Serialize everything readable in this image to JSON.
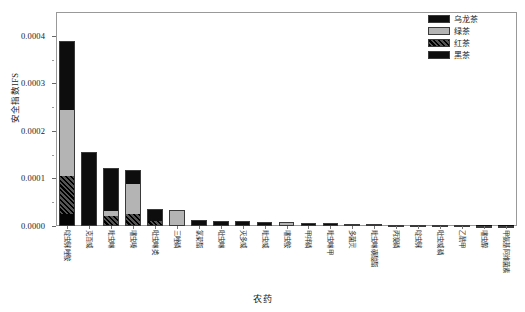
{
  "chart_data": {
    "type": "bar",
    "stacked": true,
    "title": "",
    "xlabel": "农药",
    "ylabel": "安全指数IFS",
    "ylim": [
      0.0,
      0.00045
    ],
    "ytick_values": [
      0.0,
      0.0001,
      0.0002,
      0.0003,
      0.0004
    ],
    "ytick_labels": [
      "0.0000",
      "0.0001",
      "0.0002",
      "0.0003",
      "0.0004"
    ],
    "grid": false,
    "legend_position": "top-right",
    "categories": [
      "啶虫脒唑胺",
      "克百威",
      "毗虫啉",
      "噻虫嗪",
      "吡虫啉类",
      "三唑磷",
      "氯菊酯",
      "吡虫啉",
      "灭多威",
      "毗虫威",
      "噻虫胺",
      "甲拌磷",
      "毗虫啉甲",
      "多菌灵",
      "毗虫啉磺酸酯",
      "丙溴磷",
      "啶虫脒",
      "吡虫威磷",
      "乙酰甲",
      "噻虫醇",
      "甲氨基阿维菌素"
    ],
    "series": [
      {
        "name": "黑茶",
        "swatch": "solid-black",
        "color": "#050505",
        "values": [
          2.5e-05,
          0.0,
          0.0,
          0.0,
          0.0,
          0.0,
          0.0,
          0.0,
          0.0,
          0.0,
          0.0,
          0.0,
          0.0,
          0.0,
          0.0,
          0.0,
          0.0,
          0.0,
          0.0,
          0.0,
          0.0
        ]
      },
      {
        "name": "红茶",
        "swatch": "hatched-dark",
        "color": "#2b2b2b",
        "values": [
          8e-05,
          0.0,
          2.2e-05,
          2.6e-05,
          1.1e-05,
          0.0,
          0.0,
          0.0,
          0.0,
          0.0,
          0.0,
          0.0,
          0.0,
          0.0,
          0.0,
          0.0,
          0.0,
          0.0,
          0.0,
          0.0,
          0.0
        ]
      },
      {
        "name": "绿茶",
        "swatch": "light-gray",
        "color": "#b4b4b4",
        "values": [
          0.00014,
          0.0,
          9e-06,
          6.2e-05,
          0.0,
          3.3e-05,
          0.0,
          0.0,
          0.0,
          0.0,
          6e-06,
          0.0,
          0.0,
          0.0,
          0.0,
          0.0,
          0.0,
          0.0,
          0.0,
          0.0,
          0.0
        ]
      },
      {
        "name": "乌龙茶",
        "swatch": "solid-black",
        "color": "#0d0d0d",
        "values": [
          0.000145,
          0.000156,
          9e-05,
          3e-05,
          2.4e-05,
          0.0,
          1.3e-05,
          1.05e-05,
          9.5e-06,
          8.5e-06,
          2e-06,
          7e-06,
          6e-06,
          5.2e-06,
          3.6e-06,
          2.8e-06,
          2e-06,
          1.6e-06,
          1.2e-06,
          8e-07,
          5e-07
        ]
      }
    ],
    "legend": [
      {
        "label": "乌龙茶",
        "swatch": "solid-black"
      },
      {
        "label": "绿茶",
        "swatch": "light-gray"
      },
      {
        "label": "红茶",
        "swatch": "hatched-dark"
      },
      {
        "label": "黑茶",
        "swatch": "solid-black"
      }
    ]
  }
}
